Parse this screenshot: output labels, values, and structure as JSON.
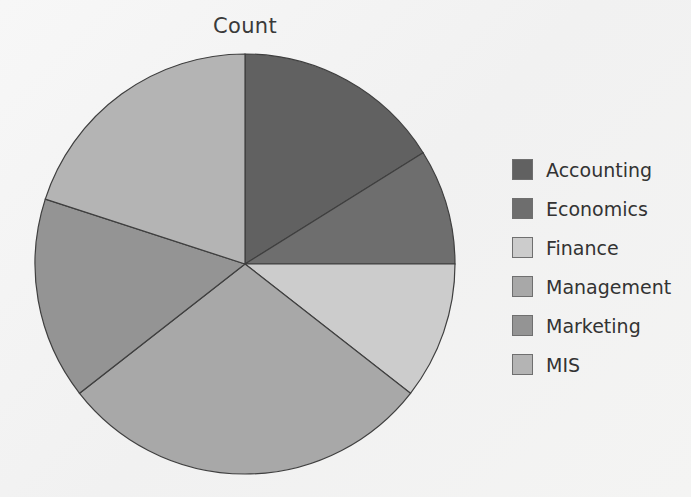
{
  "chart_data": {
    "type": "pie",
    "title": "Count",
    "xlabel": "",
    "ylabel": "",
    "legend_position": "right",
    "grid": false,
    "start_angle_deg": 0,
    "direction": "clockwise",
    "center": {
      "x": 245,
      "y": 264
    },
    "radius": 210,
    "categories": [
      "Accounting",
      "Economics",
      "Finance",
      "Management",
      "Marketing",
      "MIS"
    ],
    "values": [
      58,
      32,
      38,
      104,
      56,
      72
    ],
    "value_unit": "degrees",
    "percentages": [
      16.1,
      8.9,
      10.6,
      28.9,
      15.6,
      20.0
    ],
    "slices": [
      {
        "label": "Accounting",
        "angle_deg": 58,
        "percent": 16.1,
        "start_deg": 0,
        "end_deg": 58,
        "color": "#616161"
      },
      {
        "label": "Economics",
        "angle_deg": 32,
        "percent": 8.9,
        "start_deg": 58,
        "end_deg": 90,
        "color": "#6e6e6e"
      },
      {
        "label": "Finance",
        "angle_deg": 38,
        "percent": 10.6,
        "start_deg": 90,
        "end_deg": 128,
        "color": "#cccccc"
      },
      {
        "label": "Management",
        "angle_deg": 104,
        "percent": 28.9,
        "start_deg": 128,
        "end_deg": 232,
        "color": "#a8a8a8"
      },
      {
        "label": "Marketing",
        "angle_deg": 56,
        "percent": 15.6,
        "start_deg": 232,
        "end_deg": 288,
        "color": "#949494"
      },
      {
        "label": "MIS",
        "angle_deg": 72,
        "percent": 20.0,
        "start_deg": 288,
        "end_deg": 360,
        "color": "#b4b4b4"
      }
    ],
    "legend": [
      {
        "label": "Accounting",
        "color": "#616161"
      },
      {
        "label": "Economics",
        "color": "#6e6e6e"
      },
      {
        "label": "Finance",
        "color": "#cccccc"
      },
      {
        "label": "Management",
        "color": "#a8a8a8"
      },
      {
        "label": "Marketing",
        "color": "#949494"
      },
      {
        "label": "MIS",
        "color": "#b4b4b4"
      }
    ],
    "stroke_color": "#3f3f3f",
    "background_color": "#f4f4f4"
  }
}
